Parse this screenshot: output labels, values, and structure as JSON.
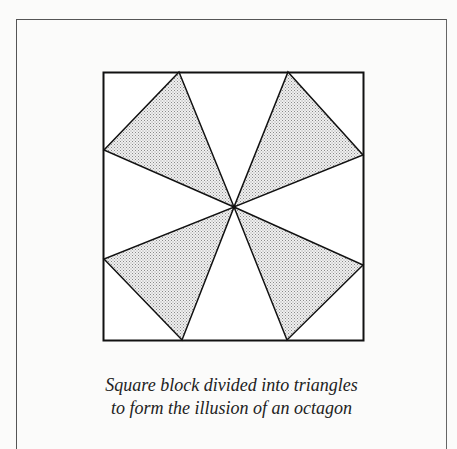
{
  "figure": {
    "fill_pattern": "stipple",
    "colors": {
      "line": "#111111",
      "shade": "#d6d6d6",
      "background": "#fbfbfa"
    },
    "shaded_triangles": 4,
    "unshaded_triangles": 4
  },
  "caption": {
    "line1": "Square block divided into triangles",
    "line2": "to form the illusion of an octagon"
  }
}
